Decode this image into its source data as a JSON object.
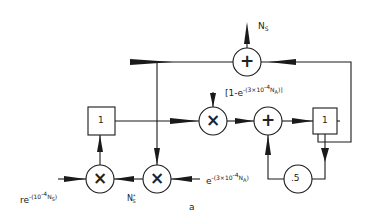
{
  "figure": {
    "caption": "a",
    "colors": {
      "stroke": "#1a1a1a",
      "background": "#ffffff"
    }
  },
  "nodes": {
    "sum_top": {
      "symbol": "+",
      "type": "adder"
    },
    "mult_mid": {
      "symbol": "×",
      "type": "multiplier"
    },
    "sum_mid": {
      "symbol": "+",
      "type": "adder"
    },
    "delay_right": {
      "symbol": "1",
      "type": "delay-box"
    },
    "delay_left": {
      "symbol": "1",
      "type": "delay-box"
    },
    "mult_bottom_left": {
      "symbol": "×",
      "type": "multiplier"
    },
    "mult_bottom_mid": {
      "symbol": "×",
      "type": "multiplier"
    },
    "gain_half": {
      "symbol": ".5",
      "type": "gain"
    }
  },
  "labels": {
    "output_ns": {
      "base": "N",
      "sub": "S"
    },
    "bracket_factor": {
      "pre": "[1-e",
      "sup": "-(3×10",
      "sup2": "-4",
      "base2": "N",
      "sub": "A",
      "post": ")]"
    },
    "input_r": {
      "pre": "re",
      "sup": "-(10",
      "sup2": "-4",
      "base2": "N",
      "sub": "S",
      "post": ")"
    },
    "input_ns_star": {
      "base": "N",
      "sup": "*",
      "sub": "S"
    },
    "input_e": {
      "pre": "e",
      "sup": "-(3×10",
      "sup2": "-4",
      "base2": "N",
      "sub": "A",
      "post": ")"
    }
  }
}
